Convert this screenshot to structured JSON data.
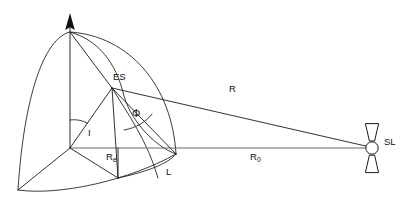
{
  "diagram": {
    "type": "geometry-schematic",
    "background_color": "#ffffff",
    "line_color": "#1a1a1a",
    "axis_color": "#555555",
    "labels": {
      "earth_station": "ES",
      "central_angle": "Φ",
      "inclination_angle": "I",
      "earth_radius": "R",
      "earth_radius_sub": "e",
      "limb_point": "L",
      "slant_range": "R",
      "orbit_radius": "R",
      "orbit_radius_sub": "0",
      "satellite": "SL"
    },
    "points": {
      "north_pole": {
        "x": 70,
        "y": 32
      },
      "earth_center": {
        "x": 70,
        "y": 148
      },
      "earth_station": {
        "x": 112,
        "y": 88
      },
      "limb": {
        "x": 175,
        "y": 153
      },
      "satellite": {
        "x": 372,
        "y": 148
      },
      "south_west": {
        "x": 18,
        "y": 190
      },
      "equator_mark": {
        "x": 118,
        "y": 178
      },
      "axis_arrow_tip": {
        "x": 70,
        "y": 14
      }
    },
    "label_positions": {
      "earth_station": {
        "x": 113,
        "y": 72
      },
      "central_angle": {
        "x": 132,
        "y": 108
      },
      "inclination_angle": {
        "x": 88,
        "y": 128
      },
      "earth_radius": {
        "x": 106,
        "y": 152
      },
      "limb_point": {
        "x": 166,
        "y": 167
      },
      "slant_range": {
        "x": 229,
        "y": 84
      },
      "orbit_radius": {
        "x": 250,
        "y": 152
      },
      "satellite": {
        "x": 384,
        "y": 137
      }
    },
    "satellite_icon": {
      "body_shape": "circle",
      "body_radius": 6.2,
      "panel_shape": "trapezoid-pair",
      "panel_orientation": "vertical"
    }
  }
}
